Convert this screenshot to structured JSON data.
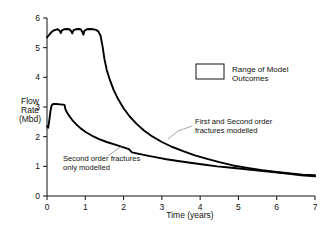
{
  "chart_data": {
    "type": "line",
    "title": "",
    "xlabel": "Time (years)",
    "ylabel": "Flow Rate (Mbd)",
    "ylabel_lines": [
      "Flow",
      "Rate",
      "(Mbd)"
    ],
    "xlim": [
      0,
      7
    ],
    "ylim": [
      0,
      6
    ],
    "xticks": [
      0,
      1,
      2,
      3,
      4,
      5,
      6,
      7
    ],
    "yticks": [
      0,
      1,
      2,
      3,
      4,
      5,
      6
    ],
    "xtick_labels": [
      "0",
      "1",
      "2",
      "3",
      "4",
      "5",
      "6",
      "7"
    ],
    "ytick_labels": [
      "0",
      "1",
      "2",
      "3",
      "4",
      "5",
      "6"
    ],
    "grid": false,
    "legend_position": "upper-right-inside",
    "legend": [
      {
        "label_lines": [
          "Range of Model",
          "Outcomes"
        ],
        "label": "Range of Model Outcomes",
        "swatch": "open-rectangle"
      }
    ],
    "series": [
      {
        "name": "First and Second order fractures modelled",
        "annotation_lines": [
          "First and Second order",
          "fractures modelled"
        ],
        "points": [
          [
            0.0,
            5.35
          ],
          [
            0.05,
            5.42
          ],
          [
            0.1,
            5.5
          ],
          [
            0.16,
            5.57
          ],
          [
            0.22,
            5.6
          ],
          [
            0.28,
            5.62
          ],
          [
            0.33,
            5.57
          ],
          [
            0.36,
            5.49
          ],
          [
            0.39,
            5.58
          ],
          [
            0.45,
            5.62
          ],
          [
            0.52,
            5.63
          ],
          [
            0.58,
            5.62
          ],
          [
            0.63,
            5.56
          ],
          [
            0.66,
            5.48
          ],
          [
            0.69,
            5.58
          ],
          [
            0.75,
            5.62
          ],
          [
            0.82,
            5.63
          ],
          [
            0.88,
            5.62
          ],
          [
            0.92,
            5.54
          ],
          [
            0.95,
            5.44
          ],
          [
            0.98,
            5.57
          ],
          [
            1.04,
            5.62
          ],
          [
            1.12,
            5.63
          ],
          [
            1.2,
            5.62
          ],
          [
            1.28,
            5.6
          ],
          [
            1.34,
            5.55
          ],
          [
            1.4,
            5.4
          ],
          [
            1.45,
            5.05
          ],
          [
            1.5,
            4.62
          ],
          [
            1.56,
            4.25
          ],
          [
            1.64,
            3.92
          ],
          [
            1.74,
            3.58
          ],
          [
            1.86,
            3.26
          ],
          [
            2.0,
            2.96
          ],
          [
            2.16,
            2.68
          ],
          [
            2.34,
            2.43
          ],
          [
            2.54,
            2.2
          ],
          [
            2.76,
            2.0
          ],
          [
            3.0,
            1.82
          ],
          [
            3.26,
            1.66
          ],
          [
            3.54,
            1.52
          ],
          [
            3.84,
            1.38
          ],
          [
            4.16,
            1.26
          ],
          [
            4.5,
            1.14
          ],
          [
            4.86,
            1.03
          ],
          [
            5.24,
            0.95
          ],
          [
            5.62,
            0.87
          ],
          [
            6.0,
            0.81
          ],
          [
            6.36,
            0.76
          ],
          [
            6.68,
            0.72
          ],
          [
            7.0,
            0.7
          ]
        ]
      },
      {
        "name": "Second order fractures only modelled",
        "annotation_lines": [
          "Second order fractures",
          "only modelled"
        ],
        "points": [
          [
            0.0,
            2.35
          ],
          [
            0.03,
            2.3
          ],
          [
            0.06,
            2.55
          ],
          [
            0.09,
            2.86
          ],
          [
            0.12,
            3.05
          ],
          [
            0.16,
            3.1
          ],
          [
            0.24,
            3.1
          ],
          [
            0.34,
            3.09
          ],
          [
            0.42,
            3.08
          ],
          [
            0.46,
            3.06
          ],
          [
            0.48,
            2.93
          ],
          [
            0.52,
            2.82
          ],
          [
            0.58,
            2.7
          ],
          [
            0.66,
            2.56
          ],
          [
            0.76,
            2.42
          ],
          [
            0.88,
            2.28
          ],
          [
            1.02,
            2.15
          ],
          [
            1.18,
            2.03
          ],
          [
            1.36,
            1.92
          ],
          [
            1.56,
            1.82
          ],
          [
            1.78,
            1.73
          ],
          [
            2.0,
            1.64
          ],
          [
            2.14,
            1.58
          ],
          [
            2.22,
            1.47
          ],
          [
            2.4,
            1.42
          ],
          [
            2.62,
            1.36
          ],
          [
            2.86,
            1.3
          ],
          [
            3.12,
            1.24
          ],
          [
            3.42,
            1.18
          ],
          [
            3.74,
            1.12
          ],
          [
            4.08,
            1.06
          ],
          [
            4.44,
            1.0
          ],
          [
            4.82,
            0.95
          ],
          [
            5.2,
            0.9
          ],
          [
            5.58,
            0.85
          ],
          [
            5.96,
            0.8
          ],
          [
            6.32,
            0.75
          ],
          [
            6.64,
            0.7
          ],
          [
            7.0,
            0.66
          ]
        ]
      }
    ],
    "annotations": [
      {
        "id": "upper-curve-annotation",
        "lines": [
          "First and Second order",
          "fractures modelled"
        ],
        "text_x": 195,
        "text_y": 121,
        "leader": [
          [
            192,
            126
          ],
          [
            178,
            131
          ],
          [
            168,
            139
          ]
        ]
      },
      {
        "id": "lower-curve-annotation",
        "lines": [
          "Second order fractures",
          "only modelled"
        ],
        "text_x": 63,
        "text_y": 158,
        "leader": [
          [
            108,
            156
          ],
          [
            116,
            150
          ],
          [
            122,
            146
          ]
        ]
      }
    ]
  }
}
